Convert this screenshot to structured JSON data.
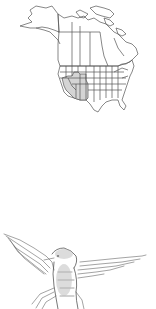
{
  "figure": {
    "map": {
      "subject": "range-map-north-america",
      "region": "North America",
      "shaded_range": [
        "Nevada",
        "Utah",
        "Colorado",
        "Arizona",
        "New Mexico",
        "southeastern California",
        "southern Idaho",
        "southwestern Wyoming",
        "western Texas"
      ],
      "shade_color": "#d4d4d4",
      "outline_color": "#555555"
    },
    "illustration": {
      "subject": "hummingbird-in-flight",
      "style": "grayscale pencil sketch",
      "stroke_color": "#666666"
    },
    "colors": {
      "background": "#ffffff"
    }
  }
}
